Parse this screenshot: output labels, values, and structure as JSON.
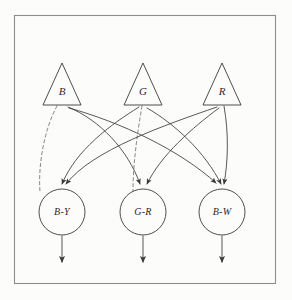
{
  "figure": {
    "background_color": "#fcfcfb",
    "frame_color": "#8d8d8d",
    "ink_color": "#3a3a3a",
    "dashed_color": "#6e6e6e"
  },
  "frame": {
    "x": 14,
    "y": 15,
    "width": 261,
    "height": 268
  },
  "receptors": [
    {
      "id": "B",
      "label": "B",
      "cx": 62,
      "base_y": 105,
      "apex_y": 63,
      "half_width": 19
    },
    {
      "id": "G",
      "label": "G",
      "cx": 143,
      "base_y": 105,
      "apex_y": 63,
      "half_width": 19
    },
    {
      "id": "R",
      "label": "R",
      "cx": 222,
      "base_y": 105,
      "apex_y": 63,
      "half_width": 19
    }
  ],
  "channels": [
    {
      "id": "BY",
      "label": "B-Y",
      "cx": 62,
      "cy": 212,
      "r": 23
    },
    {
      "id": "GR",
      "label": "G-R",
      "cx": 143,
      "cy": 212,
      "r": 23
    },
    {
      "id": "BW",
      "label": "B-W",
      "cx": 222,
      "cy": 212,
      "r": 23
    }
  ],
  "connections": [
    {
      "from": "B",
      "to": "BY",
      "style": "dashed",
      "sign": "inhibitory",
      "arrow": false,
      "path": "M 57 106 C 44 130, 38 165, 40 192"
    },
    {
      "from": "B",
      "to": "GR",
      "style": "solid",
      "sign": "excitatory",
      "arrow": true,
      "path": "M 68 107 C 100 120, 128 150, 140 184"
    },
    {
      "from": "B",
      "to": "BW",
      "style": "solid",
      "sign": "excitatory",
      "arrow": true,
      "path": "M 69 108 C 120 122, 180 150, 216 183"
    },
    {
      "from": "G",
      "to": "BY",
      "style": "solid",
      "sign": "excitatory",
      "arrow": true,
      "path": "M 139 107 C 110 125, 76 150, 62 184"
    },
    {
      "from": "G",
      "to": "GR",
      "style": "dashed",
      "sign": "inhibitory",
      "arrow": false,
      "path": "M 142 106 C 137 135, 133 165, 133 191"
    },
    {
      "from": "G",
      "to": "BW",
      "style": "solid",
      "sign": "excitatory",
      "arrow": true,
      "path": "M 147 108 C 175 124, 205 152, 221 184"
    },
    {
      "from": "R",
      "to": "BY",
      "style": "solid",
      "sign": "excitatory",
      "arrow": true,
      "path": "M 217 107 C 165 125, 92 150, 66 184"
    },
    {
      "from": "R",
      "to": "GR",
      "style": "solid",
      "sign": "excitatory",
      "arrow": true,
      "path": "M 219 108 C 192 128, 161 155, 147 184"
    },
    {
      "from": "R",
      "to": "BW",
      "style": "solid",
      "sign": "excitatory",
      "arrow": true,
      "path": "M 224 106 C 229 134, 228 162, 224 184"
    }
  ],
  "outputs": [
    {
      "from": "BY",
      "x": 62,
      "y_start": 236,
      "y_end": 262
    },
    {
      "from": "GR",
      "x": 143,
      "y_start": 236,
      "y_end": 262
    },
    {
      "from": "BW",
      "x": 222,
      "y_start": 236,
      "y_end": 262
    }
  ]
}
